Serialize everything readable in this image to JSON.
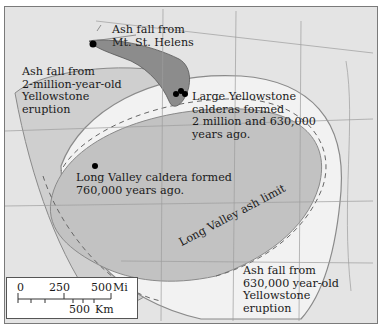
{
  "map": {
    "type": "ash-fall map",
    "colors": {
      "background": "#e4e4e4",
      "st_helens_fill": "#8c8c8c",
      "old_yellowstone_fill": "#cfcfcf",
      "long_valley_fill": "#b8b8b8",
      "young_yellowstone_fill": "#f2f2f2",
      "boundary_lines": "#9a9a9a",
      "marker": "#000000"
    },
    "labels": {
      "st_helens": [
        "Ash fall from",
        "Mt. St. Helens"
      ],
      "old_yellowstone": [
        "Ash fall from",
        "2-million-year-old",
        "Yellowstone",
        "eruption"
      ],
      "yellowstone_calderas": [
        "Large Yellowstone",
        "calderas formed",
        "2 million and 630,000",
        "years ago."
      ],
      "long_valley_caldera": [
        "Long Valley caldera formed",
        "760,000 years ago."
      ],
      "long_valley_limit": "Long Valley ash limit",
      "young_yellowstone": [
        "Ash fall from",
        "630,000 year-old",
        "Yellowstone",
        "eruption"
      ]
    },
    "markers": [
      {
        "name": "Mt. St. Helens",
        "x": 92,
        "y": 43
      },
      {
        "name": "Yellowstone calderas",
        "x": 178,
        "y": 91
      },
      {
        "name": "Long Valley caldera",
        "x": 94,
        "y": 165
      }
    ],
    "scale_bar": {
      "mi_ticks": [
        "0",
        "250",
        "500"
      ],
      "mi_unit": "Mi",
      "km_label": "500",
      "km_unit": "Km"
    }
  }
}
